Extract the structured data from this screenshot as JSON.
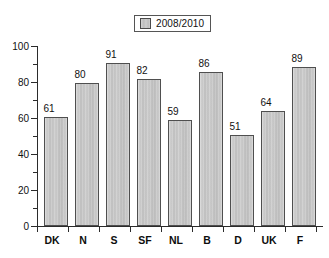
{
  "chart_data": {
    "type": "bar",
    "title": "",
    "subtitle": "",
    "xlabel": "",
    "ylabel": "",
    "categories": [
      "DK",
      "N",
      "S",
      "SF",
      "NL",
      "B",
      "D",
      "UK",
      "F"
    ],
    "values": [
      61,
      80,
      91,
      82,
      59,
      86,
      51,
      64,
      89
    ],
    "series": [
      {
        "name": "2008/2010",
        "values": [
          61,
          80,
          91,
          82,
          59,
          86,
          51,
          64,
          89
        ]
      }
    ],
    "ylim": [
      0,
      100
    ],
    "y_ticks": [
      0,
      20,
      40,
      60,
      80,
      100
    ],
    "y_tick_labels": [
      "0",
      "20",
      "40",
      "60",
      "80",
      "100"
    ],
    "y_minor_ticks": [
      10,
      30,
      50,
      70,
      90
    ],
    "grid": false,
    "legend_position": "top-center",
    "data_labels": [
      "61",
      "80",
      "91",
      "82",
      "59",
      "86",
      "51",
      "64",
      "89"
    ],
    "bar_color": "#c6c6c6",
    "bar_border_color": "#4f4f4f",
    "axis_color": "#2b2b2b",
    "background_color": "#ffffff"
  },
  "legend": {
    "swatch_name": "legend-swatch",
    "entries": [
      {
        "label": "2008/2010",
        "color": "#c6c6c6"
      }
    ]
  },
  "axes": {
    "y_tick_labels": [
      "100",
      "80",
      "60",
      "40",
      "20",
      "0"
    ],
    "x_tick_labels": [
      "DK",
      "N",
      "S",
      "SF",
      "NL",
      "B",
      "D",
      "UK",
      "F"
    ]
  }
}
